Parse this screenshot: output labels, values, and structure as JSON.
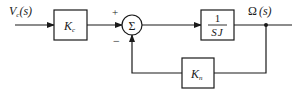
{
  "diagram": {
    "type": "block-diagram",
    "input": {
      "symbol": "V",
      "subscript": "c",
      "arg": "(s)"
    },
    "output": {
      "symbol": "Ω",
      "arg": "(s)"
    },
    "blocks": [
      {
        "id": "Kc",
        "symbol": "K",
        "subscript": "c"
      },
      {
        "id": "plant",
        "numerator": "1",
        "denominator": "SJ"
      },
      {
        "id": "Kn",
        "symbol": "K",
        "subscript": "n"
      }
    ],
    "summing_junction": {
      "symbol": "Σ",
      "plus_sign": "+",
      "minus_sign": "−"
    },
    "connections": [
      {
        "from": "input",
        "to": "Kc"
      },
      {
        "from": "Kc",
        "to": "summing_junction",
        "sign": "+"
      },
      {
        "from": "summing_junction",
        "to": "plant"
      },
      {
        "from": "plant",
        "to": "output"
      },
      {
        "from": "output",
        "to": "Kn"
      },
      {
        "from": "Kn",
        "to": "summing_junction",
        "sign": "−"
      }
    ],
    "colors": {
      "line": "#1a1a1a",
      "background": "#ffffff"
    }
  }
}
